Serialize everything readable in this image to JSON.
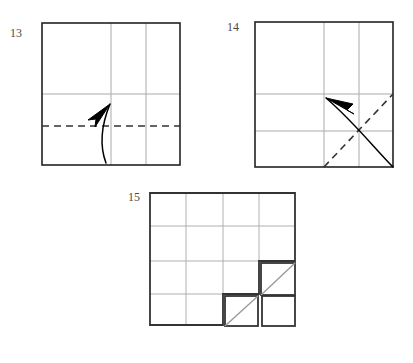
{
  "figure": {
    "type": "origami-folding-instructions",
    "title": "",
    "background_color": "#ffffff",
    "steps": [
      {
        "number": "13",
        "label": "13",
        "name": "step-13",
        "shape": "square",
        "bounds": {
          "x": 42,
          "y": 23,
          "width": 138,
          "height": 142
        },
        "outline_color": "#222222",
        "crease_color": "#aaaaaa",
        "fold_line": {
          "orientation": "horizontal",
          "position_fraction": 0.72,
          "style": "dashed",
          "color": "#333333"
        },
        "creases": [
          {
            "orientation": "vertical",
            "position_fraction": 0.5
          },
          {
            "orientation": "vertical",
            "position_fraction": 0.75
          },
          {
            "orientation": "horizontal",
            "position_fraction": 0.5
          }
        ],
        "arrow": {
          "direction": "up-left",
          "style": "curved",
          "color": "#000000"
        }
      },
      {
        "number": "14",
        "label": "14",
        "name": "step-14",
        "shape": "square",
        "bounds": {
          "x": 255,
          "y": 22,
          "width": 138,
          "height": 145
        },
        "outline_color": "#222222",
        "crease_color": "#aaaaaa",
        "fold_line": {
          "orientation": "diagonal",
          "style": "dashed",
          "color": "#333333"
        },
        "creases": [
          {
            "orientation": "vertical",
            "position_fraction": 0.5
          },
          {
            "orientation": "vertical",
            "position_fraction": 0.75
          },
          {
            "orientation": "horizontal",
            "position_fraction": 0.5
          },
          {
            "orientation": "horizontal",
            "position_fraction": 0.75
          }
        ],
        "arrow": {
          "direction": "right",
          "style": "curved",
          "color": "#000000"
        }
      },
      {
        "number": "15",
        "label": "15",
        "name": "step-15",
        "shape": "notched-grid-with-detached-squares",
        "bounds": {
          "x": 150,
          "y": 193,
          "width": 145,
          "height": 132
        },
        "outline_color": "#333333",
        "crease_color": "#b0b0b0",
        "grid": {
          "columns": 4,
          "rows": 4
        },
        "notch": {
          "description": "bottom-right 1x1 step removed",
          "columns": 1,
          "rows": 1
        },
        "detached_squares": [
          {
            "name": "square-top-right",
            "diagonal": true,
            "diagonal_direction": "bottom-left-to-top-right"
          },
          {
            "name": "square-bottom-left",
            "diagonal": true,
            "diagonal_direction": "bottom-left-to-top-right"
          },
          {
            "name": "square-bottom-right",
            "diagonal": false
          }
        ]
      }
    ]
  }
}
